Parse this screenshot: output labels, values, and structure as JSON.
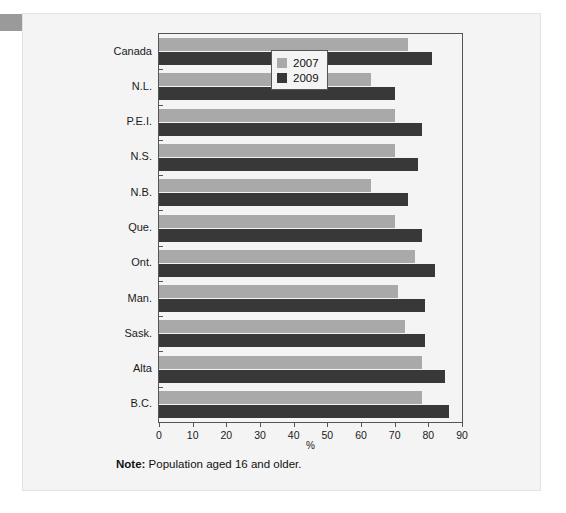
{
  "figure": {
    "note_label": "Note:",
    "note_text": "Population aged 16 and older.",
    "axis_title": "%"
  },
  "legend": {
    "position": "top-right-inside",
    "entries": [
      {
        "label": "2007",
        "color": "#a9a9a9"
      },
      {
        "label": "2009",
        "color": "#383838"
      }
    ]
  },
  "chart_data": {
    "type": "bar",
    "orientation": "horizontal",
    "title": "",
    "subtitle": "",
    "xlabel": "%",
    "ylabel": "",
    "xlim": [
      0,
      90
    ],
    "xticks": [
      0,
      10,
      20,
      30,
      40,
      50,
      60,
      70,
      80,
      90
    ],
    "xticklabels": [
      "0",
      "10",
      "20",
      "30",
      "40",
      "50",
      "60",
      "70",
      "80",
      "90"
    ],
    "grid": false,
    "legend_position": "top-right-inside",
    "categories": [
      "Canada",
      "N.L.",
      "P.E.I.",
      "N.S.",
      "N.B.",
      "Que.",
      "Ont.",
      "Man.",
      "Sask.",
      "Alta",
      "B.C."
    ],
    "series": [
      {
        "name": "2007",
        "color": "#a9a9a9",
        "values": [
          74,
          63,
          70,
          70,
          63,
          70,
          76,
          71,
          73,
          78,
          78
        ]
      },
      {
        "name": "2009",
        "color": "#383838",
        "values": [
          81,
          70,
          78,
          77,
          74,
          78,
          82,
          79,
          79,
          85,
          86
        ]
      }
    ],
    "annotations": [
      "Note: Population aged 16 and older."
    ]
  }
}
